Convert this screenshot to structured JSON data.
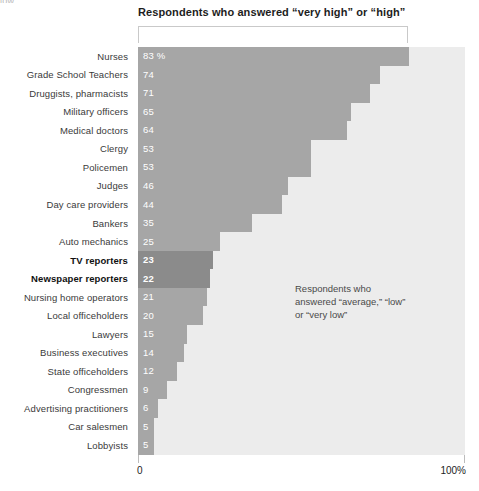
{
  "top_remnant": "low.",
  "chart_title": "Respondents who answered “very high” or “high”",
  "annotation": {
    "line1": "Respondents who",
    "line2": "answered “average,” “low”",
    "line3": "or “very low”"
  },
  "axis": {
    "left_label": "0",
    "right_label": "100%"
  },
  "colors": {
    "bar": "#a6a6a6",
    "bar_highlight": "#8b8b8b",
    "plot_background": "#ececec",
    "bracket": "#c9c9c9",
    "value_text": "#ffffff",
    "label_text": "#3a3a3a"
  },
  "chart_data": {
    "type": "bar",
    "orientation": "horizontal",
    "title": "Respondents who answered “very high” or “high”",
    "xlabel": "",
    "ylabel": "",
    "xlim": [
      0,
      100
    ],
    "grid": false,
    "legend": false,
    "value_suffix": "%",
    "categories": [
      "Nurses",
      "Grade School Teachers",
      "Druggists, pharmacists",
      "Military officers",
      "Medical doctors",
      "Clergy",
      "Policemen",
      "Judges",
      "Day care providers",
      "Bankers",
      "Auto mechanics",
      "TV reporters",
      "Newspaper reporters",
      "Nursing home operators",
      "Local officeholders",
      "Lawyers",
      "Business executives",
      "State officeholders",
      "Congressmen",
      "Advertising practitioners",
      "Car salesmen",
      "Lobbyists"
    ],
    "values": [
      83,
      74,
      71,
      65,
      64,
      53,
      53,
      46,
      44,
      35,
      25,
      23,
      22,
      21,
      20,
      15,
      14,
      12,
      9,
      6,
      5,
      5
    ],
    "value_labels": [
      "83 %",
      "74",
      "71",
      "65",
      "64",
      "53",
      "53",
      "46",
      "44",
      "35",
      "25",
      "23",
      "22",
      "21",
      "20",
      "15",
      "14",
      "12",
      "9",
      "6",
      "5",
      "5"
    ],
    "highlighted": [
      "TV reporters",
      "Newspaper reporters"
    ],
    "annotations": [
      "Respondents who answered “average,” “low” or “very low”"
    ]
  }
}
